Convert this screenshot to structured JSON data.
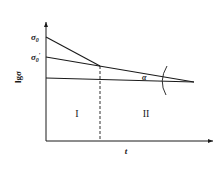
{
  "diagram": {
    "type": "stress-relaxation log plot",
    "y_axis_label": "lgσ",
    "x_axis_label": "t",
    "y_labels": {
      "sigma0": "σ",
      "sigma0_sub": "0",
      "sigma0_prime": "σ",
      "sigma0_prime_sub": "0",
      "sigma0_prime_mark": "′"
    },
    "angle_label": "α",
    "regions": [
      {
        "label": "I"
      },
      {
        "label": "II"
      }
    ],
    "colors": {
      "line": "#1a1a1a",
      "background": "#ffffff"
    }
  }
}
